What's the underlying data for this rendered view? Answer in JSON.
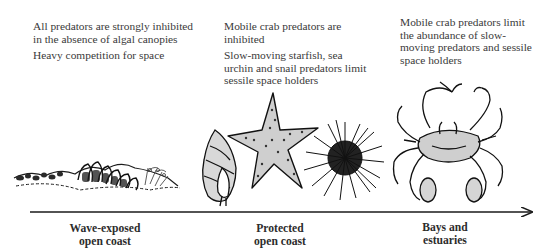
{
  "diagram": {
    "type": "gradient-axis",
    "axis": {
      "direction": "left-to-right",
      "arrow": true,
      "color": "#1a1a1a"
    },
    "zones": [
      {
        "label_line1": "Wave-exposed",
        "label_line2": "open coast",
        "notes": [
          "All predators are strongly inhibited in the absence of algal canopies",
          "Heavy competition for space"
        ],
        "illustration": "mussel-barnacle-bed"
      },
      {
        "label_line1": "Protected",
        "label_line2": "open coast",
        "notes": [
          "Mobile crab predators are inhibited",
          "Slow-moving starfish, sea urchin and snail predators limit sessile space holders"
        ],
        "illustration": "snail-starfish-urchin"
      },
      {
        "label_line1": "Bays and",
        "label_line2": "estuaries",
        "notes": [
          "Mobile crab predators limit the abundance of slow-moving predators and sessile space holders"
        ],
        "illustration": "crab"
      }
    ]
  }
}
